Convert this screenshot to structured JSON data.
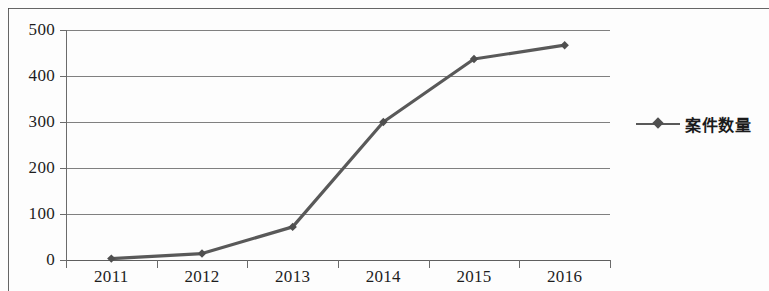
{
  "chart_data": {
    "type": "line",
    "title": "",
    "subtitle": "",
    "xlabel": "",
    "ylabel": "",
    "categories": [
      "2011",
      "2012",
      "2013",
      "2014",
      "2015",
      "2016"
    ],
    "series": [
      {
        "name": "案件数量",
        "values": [
          3,
          14,
          72,
          300,
          437,
          467
        ],
        "color": "#595959",
        "marker": "diamond"
      }
    ],
    "ylim": [
      0,
      500
    ],
    "ytick_labels": [
      "0",
      "100",
      "200",
      "300",
      "400",
      "500"
    ],
    "ytick_values": [
      0,
      100,
      200,
      300,
      400,
      500
    ],
    "grid": "horizontal",
    "legend_position": "right",
    "legend_entries": [
      "案件数量"
    ]
  },
  "legend": {
    "label": "案件数量",
    "marker_icon": "line-diamond-marker-icon"
  },
  "axes": {
    "y": {
      "ticks": [
        "500",
        "400",
        "300",
        "200",
        "100",
        "0"
      ]
    },
    "x": {
      "ticks": [
        "2011",
        "2012",
        "2013",
        "2014",
        "2015",
        "2016"
      ]
    }
  }
}
